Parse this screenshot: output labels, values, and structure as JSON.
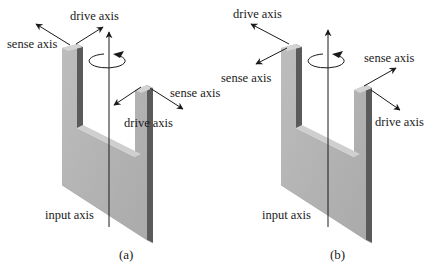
{
  "figure": {
    "panels": [
      {
        "id": "a",
        "caption": "(a)",
        "labels": {
          "drive_top": "drive axis",
          "sense_top": "sense axis",
          "sense_right": "sense axis",
          "drive_right": "drive axis",
          "input": "input axis"
        }
      },
      {
        "id": "b",
        "caption": "(b)",
        "labels": {
          "drive_top": "drive axis",
          "sense_top": "sense axis",
          "sense_right": "sense axis",
          "drive_right": "drive axis",
          "input": "input axis"
        }
      }
    ],
    "colors": {
      "front_face": "#b4b4b4",
      "top_face": "#d2d2d2",
      "side_face": "#5a5a5a",
      "line": "#1a1a1a",
      "background": "#ffffff"
    }
  }
}
